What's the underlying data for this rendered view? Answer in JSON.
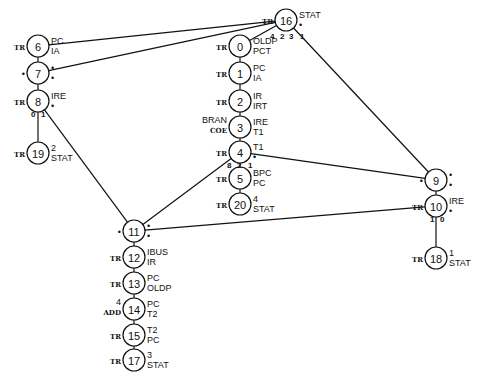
{
  "diagram": {
    "type": "state-graph",
    "nodes": [
      {
        "id": "6",
        "x": 38,
        "y": 46,
        "left": "TR",
        "right1": "PC",
        "right2": "IA"
      },
      {
        "id": "7",
        "x": 38,
        "y": 73,
        "left": "•",
        "right1": "•",
        "right2": "•"
      },
      {
        "id": "8",
        "x": 38,
        "y": 101,
        "left": "TR",
        "right1": "IRE",
        "right2": "•"
      },
      {
        "id": "19",
        "x": 38,
        "y": 153,
        "left": "TR",
        "right1": "2",
        "right2": "STAT"
      },
      {
        "id": "16",
        "x": 286,
        "y": 20,
        "left": "TR",
        "right1": "STAT",
        "right2": "•"
      },
      {
        "id": "0",
        "x": 240,
        "y": 46,
        "left": "TR",
        "right1": "OLDP",
        "right2": "PCT"
      },
      {
        "id": "1",
        "x": 240,
        "y": 73,
        "left": "TR",
        "right1": "PC",
        "right2": "IA"
      },
      {
        "id": "2",
        "x": 240,
        "y": 101,
        "left": "TR",
        "right1": "IR",
        "right2": "IRT"
      },
      {
        "id": "3",
        "x": 240,
        "y": 127,
        "left": "BRAN\nCOE",
        "right1": "IRE",
        "right2": "T1"
      },
      {
        "id": "4",
        "x": 240,
        "y": 152,
        "left": "TR",
        "right1": "T1",
        "right2": "•"
      },
      {
        "id": "5",
        "x": 240,
        "y": 178,
        "left": "TR",
        "right1": "BPC",
        "right2": "PC"
      },
      {
        "id": "20",
        "x": 240,
        "y": 204,
        "left": "TR",
        "right1": "4",
        "right2": "STAT"
      },
      {
        "id": "9",
        "x": 436,
        "y": 180,
        "left": "•",
        "right1": "•",
        "right2": "•"
      },
      {
        "id": "10",
        "x": 436,
        "y": 206,
        "left": "TR",
        "right1": "IRE",
        "right2": "•"
      },
      {
        "id": "18",
        "x": 436,
        "y": 258,
        "left": "TR",
        "right1": "1",
        "right2": "STAT"
      },
      {
        "id": "11",
        "x": 134,
        "y": 231,
        "left": "•",
        "right1": "•",
        "right2": "•"
      },
      {
        "id": "12",
        "x": 134,
        "y": 257,
        "left": "TR",
        "right1": "IBUS",
        "right2": "IR"
      },
      {
        "id": "13",
        "x": 134,
        "y": 283,
        "left": "TR",
        "right1": "PC",
        "right2": "OLDP"
      },
      {
        "id": "14",
        "x": 134,
        "y": 309,
        "left": "4\nADD",
        "right1": "PC",
        "right2": "T2"
      },
      {
        "id": "15",
        "x": 134,
        "y": 335,
        "left": "TR",
        "right1": "T2",
        "right2": "PC"
      },
      {
        "id": "17",
        "x": 134,
        "y": 360,
        "left": "TR",
        "right1": "3",
        "right2": "STAT"
      }
    ],
    "edges": [
      {
        "from": "6",
        "to": "7"
      },
      {
        "from": "7",
        "to": "8"
      },
      {
        "from": "8",
        "to": "19"
      },
      {
        "from": "0",
        "to": "1"
      },
      {
        "from": "1",
        "to": "2"
      },
      {
        "from": "2",
        "to": "3"
      },
      {
        "from": "3",
        "to": "4"
      },
      {
        "from": "4",
        "to": "5"
      },
      {
        "from": "5",
        "to": "20"
      },
      {
        "from": "9",
        "to": "10"
      },
      {
        "from": "10",
        "to": "18"
      },
      {
        "from": "11",
        "to": "12"
      },
      {
        "from": "12",
        "to": "13"
      },
      {
        "from": "13",
        "to": "14"
      },
      {
        "from": "14",
        "to": "15"
      },
      {
        "from": "15",
        "to": "17"
      },
      {
        "from": "16",
        "to": "6"
      },
      {
        "from": "16",
        "to": "7"
      },
      {
        "from": "16",
        "to": "0"
      },
      {
        "from": "16",
        "to": "9"
      },
      {
        "from": "8",
        "to": "11"
      },
      {
        "from": "11",
        "to": "4"
      },
      {
        "from": "4",
        "to": "9"
      },
      {
        "from": "11",
        "to": "10"
      }
    ],
    "port_labels": [
      {
        "text": "4",
        "x": 270,
        "y": 39
      },
      {
        "text": "2",
        "x": 280,
        "y": 39
      },
      {
        "text": "3",
        "x": 289,
        "y": 39
      },
      {
        "text": "1",
        "x": 300,
        "y": 39
      },
      {
        "text": "0",
        "x": 31,
        "y": 117
      },
      {
        "text": "1",
        "x": 41,
        "y": 117
      },
      {
        "text": "8",
        "x": 227,
        "y": 168
      },
      {
        "text": "2",
        "x": 237,
        "y": 168
      },
      {
        "text": "1",
        "x": 248,
        "y": 168
      },
      {
        "text": "1",
        "x": 430,
        "y": 222
      },
      {
        "text": "0",
        "x": 440,
        "y": 222
      }
    ]
  }
}
